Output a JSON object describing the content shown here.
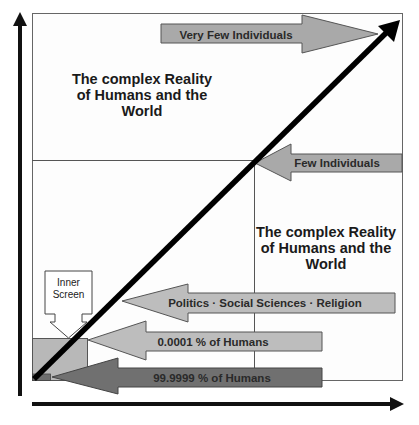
{
  "diagram": {
    "axes": {
      "x_arrow": "right",
      "y_arrow": "up",
      "x_label_visible": false,
      "y_label_visible": false
    },
    "regions": {
      "upper_text": [
        "The complex Reality",
        "of Humans and the",
        "World"
      ],
      "lower_right_text": [
        "The complex Reality",
        "of Humans and the",
        "World"
      ]
    },
    "arrows": [
      {
        "id": "very-few",
        "label": "Very Few Individuals",
        "direction": "right",
        "color": "#a9a9a9"
      },
      {
        "id": "few",
        "label": "Few Individuals",
        "direction": "left",
        "color": "#a9a9a9"
      },
      {
        "id": "politics",
        "label": "Politics · Social Sciences · Religion",
        "direction": "left",
        "color": "#bdbdbd"
      },
      {
        "id": "small-pct",
        "label": "0.0001 % of Humans",
        "direction": "left",
        "color": "#bdbdbd"
      },
      {
        "id": "majority",
        "label": "99.9999 % of Humans",
        "direction": "left",
        "color": "#707070"
      }
    ],
    "inner_screen": {
      "label_lines": [
        "Inner",
        "Screen"
      ]
    },
    "colors": {
      "frame": "#555555",
      "axis": "#111111",
      "diagonal": "#000000",
      "light_fill": "#bdbdbd",
      "medium_fill": "#a9a9a9",
      "dark_fill": "#707070",
      "inner_rect_light": "#b5b5b5",
      "inner_rect_dark": "#6e6e6e"
    }
  }
}
